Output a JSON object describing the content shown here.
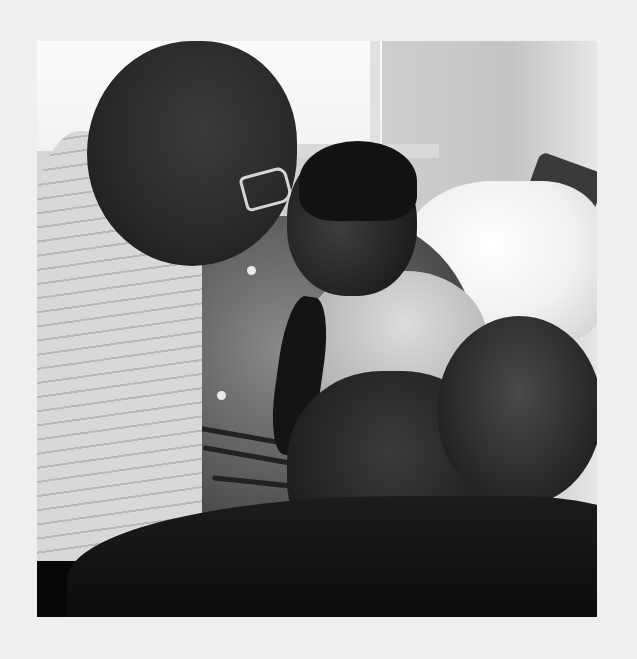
{
  "image": {
    "type": "photograph",
    "style": "black-and-white",
    "frame_color": "#efefef",
    "subject": "man with glasses leaning toward smiling child on bed holding teddy bear",
    "palette": {
      "frame": "#efefef",
      "highlight": "#fbfbfb",
      "midtone": "#8a8a8a",
      "shadow": "#0a0a0a"
    }
  }
}
